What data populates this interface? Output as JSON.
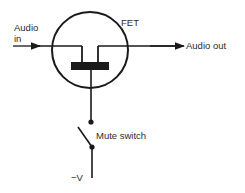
{
  "diagram": {
    "labels": {
      "audio_in_line1": "Audio",
      "audio_in_line2": "in",
      "fet": "FET",
      "audio_out": "Audio out",
      "mute_switch": "Mute switch",
      "neg_v": "−V"
    },
    "colors": {
      "stroke": "#1a1a1a",
      "text": "#2b2b2b",
      "background": "#ffffff"
    }
  }
}
